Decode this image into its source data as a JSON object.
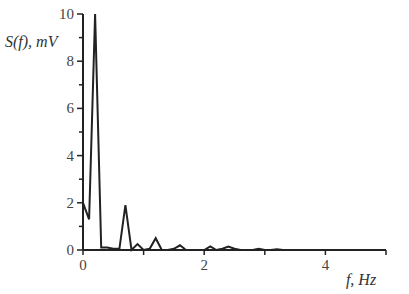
{
  "chart_data": {
    "type": "line",
    "title": "",
    "xlabel": "f, Hz",
    "ylabel": "S(f), mV",
    "xlim": [
      0,
      5
    ],
    "ylim": [
      0,
      10
    ],
    "grid": false,
    "legend": null,
    "x_ticks": [
      0,
      1,
      2,
      3,
      4,
      5
    ],
    "x_tick_labels": [
      "0",
      "",
      "2",
      "",
      "4",
      ""
    ],
    "y_ticks": [
      0,
      2,
      4,
      6,
      8,
      10
    ],
    "y_tick_labels": [
      "0",
      "2",
      "4",
      "6",
      "8",
      "10"
    ],
    "y_minor_ticks": [
      1,
      3,
      5,
      7,
      9
    ],
    "series": [
      {
        "name": "S(f)",
        "color": "#222222",
        "x": [
          0,
          0.1,
          0.2,
          0.3,
          0.4,
          0.5,
          0.6,
          0.7,
          0.8,
          0.9,
          1.0,
          1.1,
          1.2,
          1.3,
          1.4,
          1.5,
          1.6,
          1.7,
          1.8,
          1.9,
          2.0,
          2.1,
          2.2,
          2.3,
          2.4,
          2.5,
          2.6,
          2.7,
          2.8,
          2.9,
          3.0,
          3.1,
          3.2,
          3.3,
          3.5,
          4.0,
          4.5,
          5.0
        ],
        "values": [
          2.0,
          1.3,
          10.0,
          0.1,
          0.1,
          0.05,
          0.05,
          1.9,
          0.0,
          0.25,
          0.0,
          0.05,
          0.5,
          0.0,
          0.0,
          0.05,
          0.2,
          0.0,
          0.0,
          0.0,
          0.0,
          0.15,
          0.0,
          0.05,
          0.15,
          0.05,
          0.0,
          0.0,
          0.0,
          0.05,
          0.0,
          0.0,
          0.03,
          0.0,
          0.0,
          0.0,
          0.0,
          0.0
        ]
      }
    ]
  }
}
